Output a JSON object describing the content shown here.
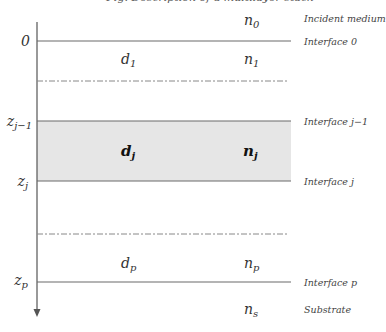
{
  "caption": "Fig. Description of a multilayer stack",
  "axis": {
    "direction": "z, downward",
    "color": "#555555"
  },
  "colors": {
    "line": "#6a6a6a",
    "dashdot": "#888888",
    "shade": "#e6e6e6",
    "text": "#333333"
  },
  "z_labels": [
    {
      "id": "z0",
      "base": "0",
      "sub": ""
    },
    {
      "id": "zj-1",
      "base": "z",
      "sub": "j−1"
    },
    {
      "id": "zj",
      "base": "z",
      "sub": "j"
    },
    {
      "id": "zp",
      "base": "z",
      "sub": "p"
    }
  ],
  "layers": [
    {
      "name": "incident",
      "d": null,
      "n": {
        "base": "n",
        "sub": "0"
      },
      "label": "Incident medium"
    },
    {
      "name": "layer-1",
      "d": {
        "base": "d",
        "sub": "1"
      },
      "n": {
        "base": "n",
        "sub": "1"
      }
    },
    {
      "name": "layer-j",
      "d": {
        "base": "d",
        "sub": "j"
      },
      "n": {
        "base": "n",
        "sub": "j"
      },
      "highlighted": true
    },
    {
      "name": "layer-p",
      "d": {
        "base": "d",
        "sub": "p"
      },
      "n": {
        "base": "n",
        "sub": "p"
      }
    },
    {
      "name": "substrate",
      "d": null,
      "n": {
        "base": "n",
        "sub": "s"
      },
      "label": "Substrate"
    }
  ],
  "interfaces": [
    {
      "label": "Interface 0",
      "style": "solid"
    },
    {
      "label": "Interface j−1",
      "style": "solid"
    },
    {
      "label": "Interface j",
      "style": "solid"
    },
    {
      "label": "Interface p",
      "style": "solid"
    }
  ],
  "separators": [
    {
      "style": "dash-dot",
      "meaning": "omitted layers 2..j−1"
    },
    {
      "style": "dash-dot",
      "meaning": "omitted layers j+1..p−1"
    }
  ]
}
